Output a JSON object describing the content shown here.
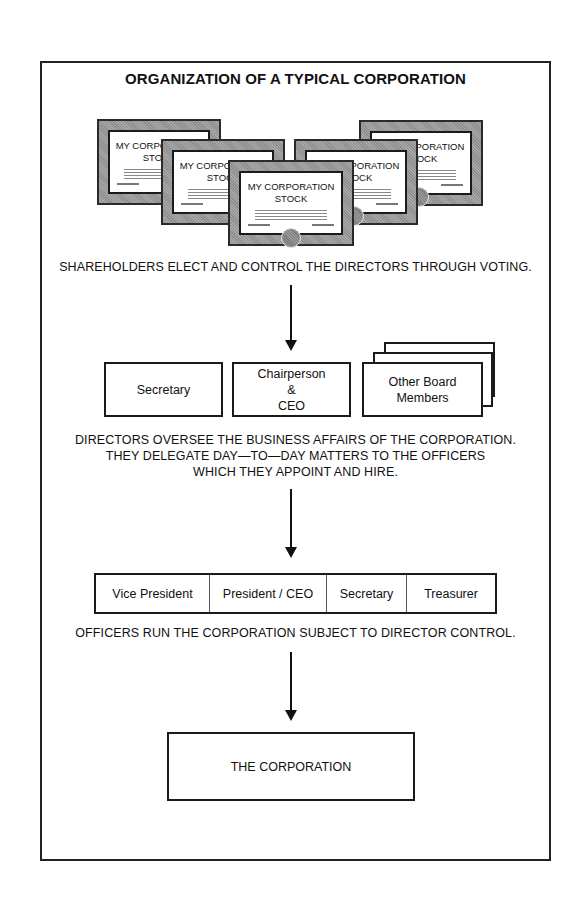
{
  "title": "ORGANIZATION OF A TYPICAL CORPORATION",
  "certificates": [
    {
      "title": "MY CORPORATION\nSTOCK",
      "position": "back-left"
    },
    {
      "title": "MY CORPORATION\nSTOCK",
      "position": "back-right"
    },
    {
      "title": "MY CORPORATION\nSTOCK",
      "position": "mid-left"
    },
    {
      "title": "MY CORPORATION\nSTOCK",
      "position": "mid-right"
    },
    {
      "title": "MY CORPORATION\nSTOCK",
      "position": "front-center"
    }
  ],
  "shareholders_caption": "SHAREHOLDERS ELECT AND CONTROL THE DIRECTORS THROUGH VOTING.",
  "directors": {
    "boxes": [
      {
        "label": "Secretary"
      },
      {
        "label": "Chairperson\n&\nCEO"
      },
      {
        "label": "Other Board\nMembers",
        "stacked": true
      }
    ],
    "caption_lines": [
      "DIRECTORS OVERSEE THE BUSINESS AFFAIRS OF THE CORPORATION.",
      "THEY DELEGATE DAY—TO—DAY MATTERS TO THE OFFICERS",
      "WHICH THEY APPOINT AND HIRE."
    ]
  },
  "officers": {
    "roles": [
      "Vice President",
      "President / CEO",
      "Secretary",
      "Treasurer"
    ],
    "caption": "OFFICERS RUN THE CORPORATION SUBJECT TO DIRECTOR CONTROL."
  },
  "corporation": {
    "label": "THE CORPORATION"
  },
  "colors": {
    "line": "#1a1a1a",
    "frame_fill": "#9c9c9c",
    "background": "#ffffff"
  }
}
